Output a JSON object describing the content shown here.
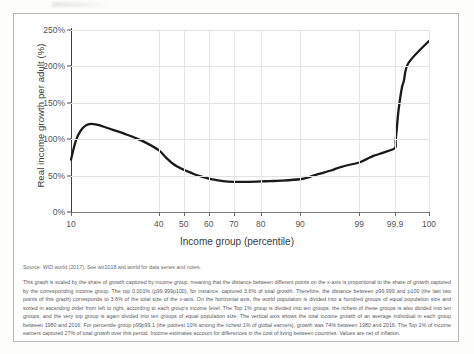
{
  "figure": {
    "source_line": "Source: WID.world (2017). See wir2018.wid.world for data series and notes.",
    "note": "This graph is scaled by the share of growth captured by income group, meaning that the distance between different points on the x-axis is proportional to the share of growth captured by the corresponding income group. The top 0.001% (p99.999p100), for instance, captured 3.6% of total growth. Therefore, the distance between p99.999 and p100 (the last two points of this graph) corresponds to 3.6% of the total size of the x-axis. On the horizontal axis, the world population is divided into a hundred groups of equal population size and sorted in ascending order from left to right, according to each group's income level. The Top 1% group is divided into ten groups, the richest of these groups is also divided into ten groups, and the very top group is again divided into ten groups of equal population size. The vertical axis shows the total income growth of an average individual in each group between 1980 and 2016. For percentile group p99p99.1 (the poorest 10% among the richest 1% of global earners), growth was 74% between 1980 and 2016. The Top 1% of income earners captured 27% of total growth over this period. Income estimates account for differences in the cost of living between countries. Values are net of inflation."
  },
  "chart_data": {
    "type": "line",
    "title": "",
    "xlabel": "Income group (percentile)",
    "ylabel": "Real income growth per adult (%)",
    "ylim": [
      0,
      250
    ],
    "ytick_labels": [
      "0%",
      "50%",
      "100%",
      "150%",
      "200%",
      "250%"
    ],
    "ytick_values": [
      0,
      50,
      100,
      150,
      200,
      250
    ],
    "xtick_labels": [
      "10",
      "40",
      "50",
      "60",
      "70",
      "80",
      "90",
      "99",
      "99.9",
      "100"
    ],
    "xtick_values": [
      10,
      40,
      50,
      60,
      70,
      80,
      90,
      99,
      99.9,
      100
    ],
    "grid": true,
    "legend": "none",
    "series": [
      {
        "name": "Real income growth per adult 1980-2016",
        "color": "#1a1a1a",
        "x": [
          10,
          12,
          14,
          16,
          18,
          20,
          22,
          25,
          28,
          30,
          33,
          36,
          40,
          43,
          46,
          50,
          53,
          56,
          60,
          63,
          66,
          70,
          73,
          76,
          80,
          83,
          86,
          90,
          93,
          95,
          97,
          98,
          99,
          99.2,
          99.4,
          99.6,
          99.8,
          99.9,
          99.92,
          99.95,
          99.97,
          99.99,
          99.995,
          99.999,
          100
        ],
        "values": [
          72,
          98,
          112,
          119,
          121,
          120,
          118,
          114,
          110,
          107,
          102,
          96,
          85,
          75,
          66,
          58,
          54,
          50,
          46,
          44,
          42.5,
          41.5,
          41.5,
          41.5,
          42,
          42.5,
          43,
          45,
          48,
          52,
          57,
          62,
          68,
          70,
          73,
          77,
          82,
          88,
          98,
          118,
          140,
          170,
          180,
          205,
          235
        ]
      }
    ]
  }
}
